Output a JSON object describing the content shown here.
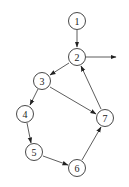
{
  "diagram": {
    "type": "directed-graph",
    "nodes": [
      {
        "id": "1",
        "label": "1",
        "x": 77,
        "y": 21
      },
      {
        "id": "2",
        "label": "2",
        "x": 77,
        "y": 57
      },
      {
        "id": "3",
        "label": "3",
        "x": 42,
        "y": 81
      },
      {
        "id": "4",
        "label": "4",
        "x": 25,
        "y": 114
      },
      {
        "id": "5",
        "label": "5",
        "x": 34,
        "y": 152
      },
      {
        "id": "6",
        "label": "6",
        "x": 77,
        "y": 168
      },
      {
        "id": "7",
        "label": "7",
        "x": 105,
        "y": 118
      }
    ],
    "edges": [
      {
        "from": "1",
        "to": "2"
      },
      {
        "from": "2",
        "to": "3"
      },
      {
        "from": "3",
        "to": "4"
      },
      {
        "from": "3",
        "to": "7"
      },
      {
        "from": "4",
        "to": "5"
      },
      {
        "from": "5",
        "to": "6"
      },
      {
        "from": "6",
        "to": "7"
      },
      {
        "from": "7",
        "to": "2"
      },
      {
        "from": "2",
        "to": "exit"
      }
    ]
  }
}
